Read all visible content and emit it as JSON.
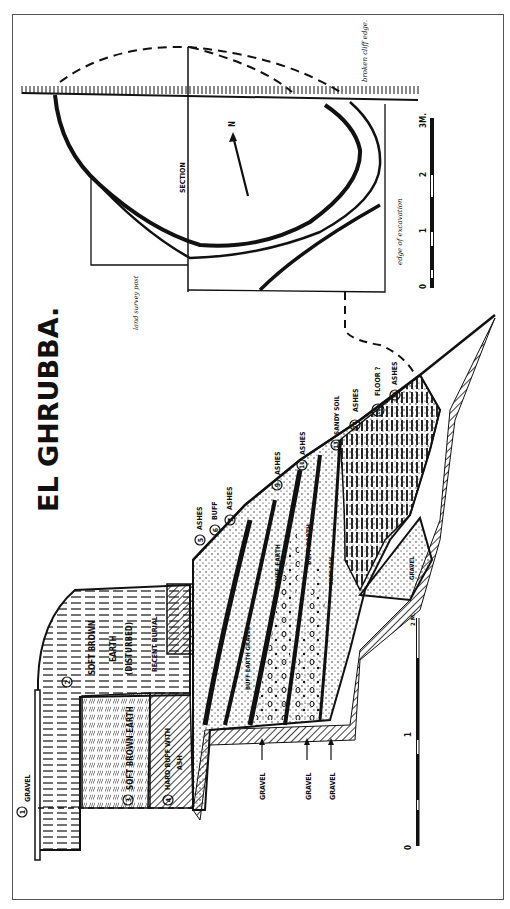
{
  "title": "EL GHRUBBA.",
  "plan": {
    "section_label": "SECTION",
    "north_label": "N",
    "note_cliff": "broken cliff edge.",
    "note_excavation": "edge of excavation",
    "note_survey": "land survey post",
    "scale": {
      "ticks": [
        "0",
        "1",
        "2",
        "3M."
      ]
    }
  },
  "section": {
    "layers": [
      {
        "num": "1",
        "label": "GRAVEL"
      },
      {
        "num": "2",
        "label": "SOFT BROWN EARTH (DISTURBED)"
      },
      {
        "num": "3",
        "label": "SOFT BROWN EARTH"
      },
      {
        "num": "4",
        "label": "HARD BUFF WITH ASH"
      },
      {
        "num": "5",
        "label": "ASHES"
      },
      {
        "num": "6",
        "label": "BUFF"
      },
      {
        "num": "7",
        "label": "ASHES"
      },
      {
        "num": "8",
        "label": "BUFF EARTH GRAVEL"
      },
      {
        "num": "9",
        "label": "ASHES"
      },
      {
        "num": "10",
        "label": "BUFF EARTH"
      },
      {
        "num": "11",
        "label": "ASHES"
      },
      {
        "num": "12",
        "label": "BUFF EARTH"
      },
      {
        "num": "13",
        "label": "SANDY SOIL"
      },
      {
        "num": "14",
        "label": "ASHES"
      },
      {
        "num": "16a",
        "label": "FLOOR ?"
      },
      {
        "num": "16",
        "label": "ASHES"
      },
      {
        "num": "17",
        "label": "GRAVEL"
      }
    ],
    "recent_burial": "RECENT BURIAL",
    "soft_ash": "SOFT ASH",
    "gravel_arrows": [
      "GRAVEL",
      "GRAVEL",
      "GRAVEL"
    ],
    "scale": {
      "ticks": [
        "0",
        "1",
        "2 M."
      ]
    }
  }
}
